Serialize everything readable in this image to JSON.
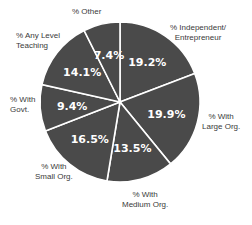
{
  "chart_data": {
    "type": "pie",
    "title": "",
    "start_angle": "12 o'clock",
    "direction": "clockwise",
    "slice_color": "#4a4a4a",
    "separator_color": "#ffffff",
    "categories": [
      "% Independent/ Entrepreneur",
      "% With Large Org.",
      "% With Medium Org.",
      "% With Small Org.",
      "% With Govt.",
      "% Any Level Teaching",
      "% Other"
    ],
    "values": [
      19.2,
      19.9,
      13.5,
      16.5,
      9.4,
      14.1,
      7.4
    ],
    "value_labels": [
      "19.2%",
      "19.9%",
      "13.5%",
      "16.5%",
      "9.4%",
      "14.1%",
      "7.4%"
    ]
  },
  "labels": {
    "independent": "% Independent/\nEntrepreneur",
    "large": "% With\nLarge Org.",
    "medium": "% With\nMedium Org.",
    "small": "% With\nSmall Org.",
    "govt": "% With\nGovt.",
    "teaching": "% Any Level\nTeaching",
    "other": "% Other"
  }
}
